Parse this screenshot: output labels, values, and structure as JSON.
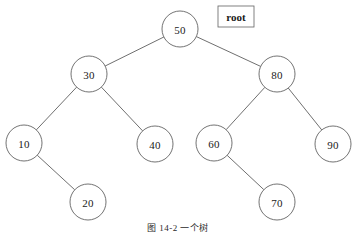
{
  "figure": {
    "background_color": "#ffffff",
    "width": 357,
    "height": 234,
    "caption": "图 14-2  一个树",
    "caption_clipped": true,
    "root_marker": {
      "label": "root",
      "box_x": 218,
      "box_y": 6,
      "box_width": 36,
      "box_height": 21,
      "border_color": "#6a6a6a"
    }
  },
  "chart_data": {
    "type": "diagram",
    "diagram_kind": "binary-search-tree",
    "title": "图 14-2  一个树",
    "node_radius": 18,
    "node_fill": "#ffffff",
    "node_stroke": "#5a5a5a",
    "edge_stroke": "#4a4a4a",
    "nodes": [
      {
        "id": "n50",
        "label": "50",
        "x": 180,
        "y": 29,
        "depth": 0,
        "side": "root"
      },
      {
        "id": "n30",
        "label": "30",
        "x": 89,
        "y": 74,
        "depth": 1,
        "side": "left"
      },
      {
        "id": "n80",
        "label": "80",
        "x": 277,
        "y": 74,
        "depth": 1,
        "side": "right"
      },
      {
        "id": "n10",
        "label": "10",
        "x": 24,
        "y": 143,
        "depth": 2,
        "side": "left"
      },
      {
        "id": "n40",
        "label": "40",
        "x": 155,
        "y": 144,
        "depth": 2,
        "side": "right"
      },
      {
        "id": "n60",
        "label": "60",
        "x": 214,
        "y": 143,
        "depth": 2,
        "side": "left"
      },
      {
        "id": "n90",
        "label": "90",
        "x": 333,
        "y": 144,
        "depth": 2,
        "side": "right"
      },
      {
        "id": "n20",
        "label": "20",
        "x": 88,
        "y": 202,
        "depth": 3,
        "side": "right"
      },
      {
        "id": "n70",
        "label": "70",
        "x": 277,
        "y": 202,
        "depth": 3,
        "side": "right"
      }
    ],
    "edges": [
      {
        "from": "n50",
        "to": "n30",
        "relation": "left-child"
      },
      {
        "from": "n50",
        "to": "n80",
        "relation": "right-child"
      },
      {
        "from": "n30",
        "to": "n10",
        "relation": "left-child"
      },
      {
        "from": "n30",
        "to": "n40",
        "relation": "right-child"
      },
      {
        "from": "n80",
        "to": "n60",
        "relation": "left-child"
      },
      {
        "from": "n80",
        "to": "n90",
        "relation": "right-child"
      },
      {
        "from": "n10",
        "to": "n20",
        "relation": "right-child"
      },
      {
        "from": "n60",
        "to": "n70",
        "relation": "right-child"
      }
    ],
    "inorder_values": [
      10,
      20,
      30,
      40,
      50,
      60,
      70,
      80,
      90
    ],
    "root_value": "50"
  }
}
